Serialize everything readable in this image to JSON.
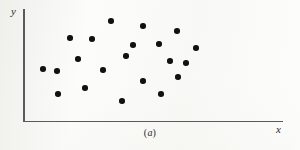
{
  "figure": {
    "caption_prefix": "(",
    "caption_letter": "a",
    "caption_suffix": ")",
    "caption_full": "(a)",
    "background_color": "#fdfdfc",
    "axis_color": "#5a5a58",
    "point_color": "#111111"
  },
  "axes": {
    "y_label": "y",
    "x_label": "x",
    "x_axis_name": "x-axis",
    "y_axis_name": "y-axis",
    "ticks": [],
    "gridlines": false
  },
  "chart_data": {
    "type": "scatter",
    "title": "(a)",
    "subtitle": "",
    "xlabel": "x",
    "ylabel": "y",
    "grid": false,
    "legend": null,
    "xlim": [
      0,
      100
    ],
    "ylim": [
      0,
      100
    ],
    "axis_ticks_shown": false,
    "n_points": 21,
    "marker": {
      "shape": "circle",
      "filled": true,
      "color": "#111111",
      "size_px": 5.6
    },
    "points": [
      {
        "x": 18.0,
        "y": 89.3
      },
      {
        "x": 62.2,
        "y": 72.3
      },
      {
        "x": 26.3,
        "y": 73.2
      },
      {
        "x": 33.6,
        "y": 89.3
      },
      {
        "x": 59.1,
        "y": 84.8
      },
      {
        "x": 7.3,
        "y": 51.8
      },
      {
        "x": 12.7,
        "y": 50.0
      },
      {
        "x": 20.8,
        "y": 44.6
      },
      {
        "x": 30.5,
        "y": 32.1
      },
      {
        "x": 39.4,
        "y": 56.3
      },
      {
        "x": 52.1,
        "y": 58.0
      },
      {
        "x": 59.5,
        "y": 41.1
      },
      {
        "x": 30.5,
        "y": 12.5
      },
      {
        "x": 23.6,
        "y": 24.1
      },
      {
        "x": 23.2,
        "y": 16.1
      },
      {
        "x": 46.3,
        "y": 55.4
      },
      {
        "x": 55.2,
        "y": 31.3
      },
      {
        "x": 64.1,
        "y": 20.5
      },
      {
        "x": 68.3,
        "y": 14.3
      },
      {
        "x": 72.2,
        "y": 36.6
      },
      {
        "x": 78.8,
        "y": 58.0
      }
    ],
    "pixel_points": [
      {
        "px": 70,
        "py": 38
      },
      {
        "px": 92,
        "py": 39
      },
      {
        "px": 111,
        "py": 21
      },
      {
        "px": 143,
        "py": 26
      },
      {
        "px": 177,
        "py": 31
      },
      {
        "px": 159,
        "py": 44
      },
      {
        "px": 196,
        "py": 48
      },
      {
        "px": 78,
        "py": 59
      },
      {
        "px": 126,
        "py": 56
      },
      {
        "px": 170,
        "py": 61
      },
      {
        "px": 43,
        "py": 69
      },
      {
        "px": 57,
        "py": 71
      },
      {
        "px": 103,
        "py": 70
      },
      {
        "px": 178,
        "py": 77
      },
      {
        "px": 143,
        "py": 81
      },
      {
        "px": 85,
        "py": 88
      },
      {
        "px": 58,
        "py": 94
      },
      {
        "px": 161,
        "py": 94
      },
      {
        "px": 122,
        "py": 101
      },
      {
        "px": 186,
        "py": 63
      },
      {
        "px": 133,
        "py": 45
      }
    ]
  }
}
